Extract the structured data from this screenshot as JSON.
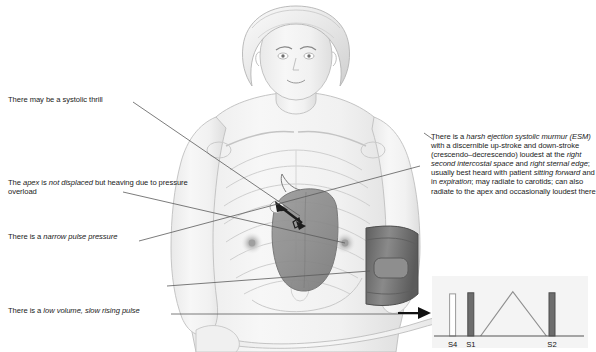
{
  "annotations": {
    "left": [
      {
        "id": "systolic-thrill",
        "segments": [
          {
            "text": "There may be a systolic thrill",
            "italic": false
          }
        ]
      },
      {
        "id": "apex-heaving",
        "segments": [
          {
            "text": "The ",
            "italic": false
          },
          {
            "text": "apex",
            "italic": true
          },
          {
            "text": " is ",
            "italic": false
          },
          {
            "text": "not displaced",
            "italic": true
          },
          {
            "text": " but heaving due to pressure overload",
            "italic": false
          }
        ]
      },
      {
        "id": "narrow-pulse-pressure",
        "segments": [
          {
            "text": "There is a ",
            "italic": false
          },
          {
            "text": "narrow pulse pressure",
            "italic": true
          }
        ]
      },
      {
        "id": "slow-rising-pulse",
        "segments": [
          {
            "text": "There is a ",
            "italic": false
          },
          {
            "text": "low volume, slow rising pulse",
            "italic": true
          }
        ]
      }
    ],
    "right": [
      {
        "id": "ejection-systolic-murmur",
        "segments": [
          {
            "text": "There is a ",
            "italic": false
          },
          {
            "text": "harsh ejection systolic murmur (ESM)",
            "italic": true
          },
          {
            "text": " with a discernible up-stroke and down-stroke (crescendo–decrescendo) loudest at the ",
            "italic": false
          },
          {
            "text": "right second intercostal space",
            "italic": true
          },
          {
            "text": " and ",
            "italic": false
          },
          {
            "text": "right sternal edge",
            "italic": true
          },
          {
            "text": "; usually best heard with patient ",
            "italic": false
          },
          {
            "text": "sitting forward",
            "italic": true
          },
          {
            "text": " and in ",
            "italic": false
          },
          {
            "text": "expiration",
            "italic": true
          },
          {
            "text": "; may radiate to carotids; can also radiate to the apex and occasionally loudest there",
            "italic": false
          }
        ]
      }
    ]
  },
  "chart_data": {
    "type": "line",
    "xlabel": "",
    "ylabel": "",
    "grid": false,
    "legend": false,
    "heart_sounds": [
      {
        "label": "S4",
        "x": 0.09,
        "height": 0.78,
        "fill": "#ffffff",
        "stroke": "#9a9a9a"
      },
      {
        "label": "S1",
        "x": 0.22,
        "height": 0.8,
        "fill": "#6d6d6d",
        "stroke": "#4d4d4d"
      },
      {
        "label": "S2",
        "x": 0.8,
        "height": 0.8,
        "fill": "#6d6d6d",
        "stroke": "#4d4d4d"
      }
    ],
    "murmur": {
      "name": "crescendo–decrescendo ejection systolic murmur",
      "shape": "diamond",
      "x": [
        0.29,
        0.52,
        0.76
      ],
      "y": [
        0.0,
        0.82,
        0.0
      ],
      "stroke": "#8f8f8f"
    },
    "baseline_y": 0.0,
    "xlim": [
      0,
      1
    ],
    "ylim": [
      0,
      1
    ]
  },
  "colors": {
    "text": "#1a1a1a",
    "leader_line": "#5a5a5a",
    "body_outline": "#b9b9b9",
    "body_fill": "#f2f2f2",
    "heart_fill": "#8d8d8d",
    "heart_stroke": "#6f6f6f",
    "cuff_fill": "#707070",
    "cuff_stroke": "#4f4f4f",
    "chart_panel": "#f4f4f4",
    "arrow": "#111111"
  }
}
